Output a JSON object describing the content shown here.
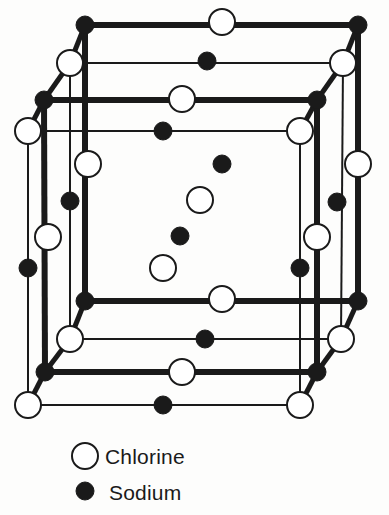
{
  "figure": {
    "background_color": "#fdfdfc",
    "ink_color": "#1a1a1a"
  },
  "legend": {
    "entries": [
      {
        "key": "chlorine",
        "label": "Chlorine",
        "marker": "open-circle",
        "marker_radius": 13,
        "fill": "#ffffff",
        "stroke": "#1a1a1a",
        "cx": 85,
        "cy": 456,
        "text_x": 105,
        "text_y": 464
      },
      {
        "key": "sodium",
        "label": "Sodium",
        "marker": "filled-circle",
        "marker_radius": 9,
        "fill": "#1a1a1a",
        "stroke": "#1a1a1a",
        "cx": 85,
        "cy": 491,
        "text_x": 109,
        "text_y": 500
      }
    ]
  },
  "lattice": {
    "description": "Face-centred cubic NaCl unit cell drawn in oblique projection; alternating sodium and chlorine ions on a 3x3x3 grid of sites.",
    "species": {
      "chlorine": {
        "radius": 13,
        "fill": "#ffffff",
        "stroke": "#1a1a1a",
        "stroke_width": 2
      },
      "sodium": {
        "radius": 9,
        "fill": "#1a1a1a",
        "stroke": "#1a1a1a",
        "stroke_width": 1
      }
    },
    "bond_styles": {
      "front": {
        "stroke": "#1a1a1a",
        "width": 6
      },
      "mid": {
        "stroke": "#1a1a1a",
        "width": 4
      },
      "back": {
        "stroke": "#1a1a1a",
        "width": 2
      },
      "vertical_front": {
        "stroke": "#1a1a1a",
        "width": 6
      },
      "vertical_mid": {
        "stroke": "#1a1a1a",
        "width": 4
      },
      "vertical_back": {
        "stroke": "#1a1a1a",
        "width": 2
      },
      "depth": {
        "stroke": "#1a1a1a",
        "width": 5
      }
    },
    "geometry": {
      "plane_offsets": [
        {
          "name": "back",
          "dx": 0,
          "dy": 0
        },
        {
          "name": "middle",
          "dx": -20,
          "dy": 36
        },
        {
          "name": "front",
          "dx": -40,
          "dy": 72
        }
      ],
      "columns_x": [
        85,
        222,
        358
      ],
      "rows_y": [
        25,
        164,
        300
      ],
      "note": "Back plane sites sit at (columns_x, rows_y); middle and front planes are shifted by the plane offsets."
    },
    "atoms": [
      {
        "id": "b00",
        "species": "sodium",
        "cx": 85,
        "cy": 25,
        "plane": "back"
      },
      {
        "id": "b10",
        "species": "chlorine",
        "cx": 222,
        "cy": 22,
        "plane": "back"
      },
      {
        "id": "b20",
        "species": "sodium",
        "cx": 358,
        "cy": 25,
        "plane": "back"
      },
      {
        "id": "b01",
        "species": "chlorine",
        "cx": 70,
        "cy": 63,
        "plane": "middle-upper"
      },
      {
        "id": "b11",
        "species": "sodium",
        "cx": 207,
        "cy": 61,
        "plane": "middle-upper"
      },
      {
        "id": "b21",
        "species": "chlorine",
        "cx": 343,
        "cy": 63,
        "plane": "middle-upper"
      },
      {
        "id": "b02",
        "species": "sodium",
        "cx": 44,
        "cy": 100,
        "plane": "front-upper"
      },
      {
        "id": "b12",
        "species": "chlorine",
        "cx": 182,
        "cy": 99,
        "plane": "front-upper"
      },
      {
        "id": "b22",
        "species": "sodium",
        "cx": 317,
        "cy": 100,
        "plane": "front-upper"
      },
      {
        "id": "b03",
        "species": "chlorine",
        "cx": 28,
        "cy": 131,
        "plane": "front-upper2"
      },
      {
        "id": "b13",
        "species": "sodium",
        "cx": 163,
        "cy": 131,
        "plane": "front-upper2"
      },
      {
        "id": "b23",
        "species": "chlorine",
        "cx": 300,
        "cy": 131,
        "plane": "front-upper2"
      },
      {
        "id": "m00",
        "species": "chlorine",
        "cx": 88,
        "cy": 164,
        "plane": "back-mid"
      },
      {
        "id": "m10",
        "species": "sodium",
        "cx": 222,
        "cy": 164,
        "plane": "back-mid"
      },
      {
        "id": "m20",
        "species": "chlorine",
        "cx": 358,
        "cy": 164,
        "plane": "back-mid"
      },
      {
        "id": "m01",
        "species": "sodium",
        "cx": 70,
        "cy": 201,
        "plane": "mid-mid"
      },
      {
        "id": "m11",
        "species": "chlorine",
        "cx": 200,
        "cy": 200,
        "plane": "mid-mid"
      },
      {
        "id": "m21",
        "species": "sodium",
        "cx": 337,
        "cy": 202,
        "plane": "mid-mid"
      },
      {
        "id": "m02",
        "species": "chlorine",
        "cx": 48,
        "cy": 237,
        "plane": "front-mid"
      },
      {
        "id": "m12",
        "species": "sodium",
        "cx": 180,
        "cy": 236,
        "plane": "front-mid"
      },
      {
        "id": "m22",
        "species": "chlorine",
        "cx": 317,
        "cy": 237,
        "plane": "front-mid"
      },
      {
        "id": "m03",
        "species": "sodium",
        "cx": 28,
        "cy": 268,
        "plane": "front-mid2"
      },
      {
        "id": "m13",
        "species": "chlorine",
        "cx": 163,
        "cy": 268,
        "plane": "front-mid2"
      },
      {
        "id": "m23",
        "species": "sodium",
        "cx": 300,
        "cy": 268,
        "plane": "front-mid2"
      },
      {
        "id": "f00",
        "species": "sodium",
        "cx": 85,
        "cy": 301,
        "plane": "back-low"
      },
      {
        "id": "f10",
        "species": "chlorine",
        "cx": 222,
        "cy": 299,
        "plane": "back-low"
      },
      {
        "id": "f20",
        "species": "sodium",
        "cx": 358,
        "cy": 301,
        "plane": "back-low"
      },
      {
        "id": "f01",
        "species": "chlorine",
        "cx": 70,
        "cy": 339,
        "plane": "mid-low"
      },
      {
        "id": "f11",
        "species": "sodium",
        "cx": 205,
        "cy": 339,
        "plane": "mid-low"
      },
      {
        "id": "f21",
        "species": "chlorine",
        "cx": 341,
        "cy": 339,
        "plane": "mid-low"
      },
      {
        "id": "f02",
        "species": "sodium",
        "cx": 45,
        "cy": 372,
        "plane": "front-low"
      },
      {
        "id": "f12",
        "species": "chlorine",
        "cx": 182,
        "cy": 372,
        "plane": "front-low"
      },
      {
        "id": "f22",
        "species": "sodium",
        "cx": 317,
        "cy": 372,
        "plane": "front-low"
      },
      {
        "id": "f03",
        "species": "chlorine",
        "cx": 28,
        "cy": 405,
        "plane": "front-low2"
      },
      {
        "id": "f13",
        "species": "sodium",
        "cx": 163,
        "cy": 405,
        "plane": "front-low2"
      },
      {
        "id": "f23",
        "species": "chlorine",
        "cx": 300,
        "cy": 405,
        "plane": "front-low2"
      }
    ],
    "bonds": [
      {
        "x1": 85,
        "y1": 25,
        "x2": 358,
        "y2": 25,
        "style": "front"
      },
      {
        "x1": 70,
        "y1": 63,
        "x2": 343,
        "y2": 63,
        "style": "back"
      },
      {
        "x1": 44,
        "y1": 100,
        "x2": 317,
        "y2": 100,
        "style": "front"
      },
      {
        "x1": 28,
        "y1": 131,
        "x2": 300,
        "y2": 131,
        "style": "back"
      },
      {
        "x1": 85,
        "y1": 301,
        "x2": 358,
        "y2": 301,
        "style": "front"
      },
      {
        "x1": 70,
        "y1": 339,
        "x2": 341,
        "y2": 339,
        "style": "back"
      },
      {
        "x1": 45,
        "y1": 372,
        "x2": 317,
        "y2": 372,
        "style": "front"
      },
      {
        "x1": 28,
        "y1": 405,
        "x2": 300,
        "y2": 405,
        "style": "back"
      },
      {
        "x1": 85,
        "y1": 25,
        "x2": 85,
        "y2": 301,
        "style": "vertical_front"
      },
      {
        "x1": 70,
        "y1": 63,
        "x2": 70,
        "y2": 339,
        "style": "vertical_back"
      },
      {
        "x1": 44,
        "y1": 100,
        "x2": 45,
        "y2": 372,
        "style": "vertical_front"
      },
      {
        "x1": 28,
        "y1": 131,
        "x2": 28,
        "y2": 405,
        "style": "vertical_back"
      },
      {
        "x1": 358,
        "y1": 25,
        "x2": 358,
        "y2": 301,
        "style": "vertical_front"
      },
      {
        "x1": 343,
        "y1": 63,
        "x2": 341,
        "y2": 339,
        "style": "vertical_back"
      },
      {
        "x1": 317,
        "y1": 100,
        "x2": 317,
        "y2": 372,
        "style": "vertical_front"
      },
      {
        "x1": 300,
        "y1": 131,
        "x2": 300,
        "y2": 405,
        "style": "vertical_back"
      },
      {
        "x1": 85,
        "y1": 25,
        "x2": 70,
        "y2": 63,
        "style": "depth"
      },
      {
        "x1": 70,
        "y1": 63,
        "x2": 44,
        "y2": 100,
        "style": "depth"
      },
      {
        "x1": 44,
        "y1": 100,
        "x2": 28,
        "y2": 131,
        "style": "depth"
      },
      {
        "x1": 358,
        "y1": 25,
        "x2": 343,
        "y2": 63,
        "style": "depth"
      },
      {
        "x1": 343,
        "y1": 63,
        "x2": 317,
        "y2": 100,
        "style": "depth"
      },
      {
        "x1": 317,
        "y1": 100,
        "x2": 300,
        "y2": 131,
        "style": "depth"
      },
      {
        "x1": 85,
        "y1": 301,
        "x2": 70,
        "y2": 339,
        "style": "depth"
      },
      {
        "x1": 70,
        "y1": 339,
        "x2": 45,
        "y2": 372,
        "style": "depth"
      },
      {
        "x1": 45,
        "y1": 372,
        "x2": 28,
        "y2": 405,
        "style": "depth"
      },
      {
        "x1": 358,
        "y1": 301,
        "x2": 341,
        "y2": 339,
        "style": "depth"
      },
      {
        "x1": 341,
        "y1": 339,
        "x2": 317,
        "y2": 372,
        "style": "depth"
      },
      {
        "x1": 317,
        "y1": 372,
        "x2": 300,
        "y2": 405,
        "style": "depth"
      }
    ]
  }
}
